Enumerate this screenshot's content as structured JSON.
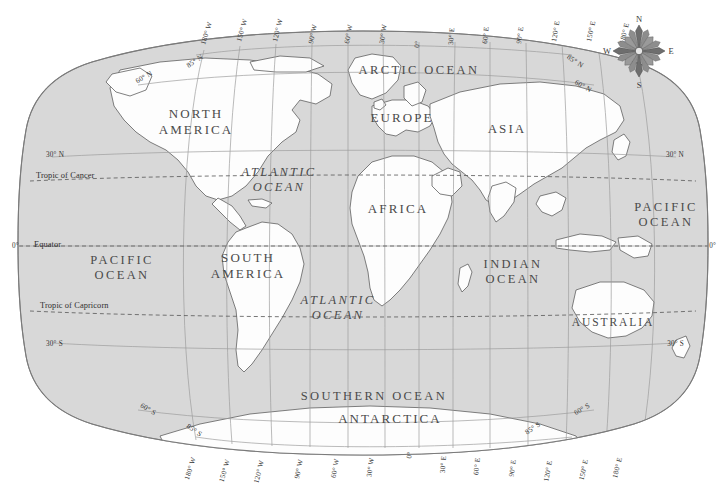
{
  "map": {
    "title": "World Map",
    "projection": "Robinson",
    "colors": {
      "ocean_fill": "#d9d9d9",
      "land_fill": "#fdfdfd",
      "graticule": "#9a9a9a",
      "coastline": "#6b6b6b",
      "outline": "#7a7a7a",
      "tropic_line": "#6f6f6f",
      "text": "#3a3a3a",
      "background": "#ffffff"
    },
    "continents": [
      {
        "label": "NORTH\nAMERICA",
        "line1": "NORTH",
        "line2": "AMERICA",
        "x": 196,
        "y": 118
      },
      {
        "label": "SOUTH\nAMERICA",
        "line1": "SOUTH",
        "line2": "AMERICA",
        "x": 248,
        "y": 262
      },
      {
        "label": "EUROPE",
        "line1": "EUROPE",
        "line2": "",
        "x": 402,
        "y": 122
      },
      {
        "label": "AFRICA",
        "line1": "AFRICA",
        "line2": "",
        "x": 398,
        "y": 213
      },
      {
        "label": "ASIA",
        "line1": "ASIA",
        "line2": "",
        "x": 507,
        "y": 133
      },
      {
        "label": "AUSTRALIA",
        "line1": "AUSTRALIA",
        "line2": "",
        "x": 613,
        "y": 326
      },
      {
        "label": "ANTARCTICA",
        "line1": "ANTARCTICA",
        "line2": "",
        "x": 390,
        "y": 423
      }
    ],
    "oceans": [
      {
        "line1": "ARCTIC",
        "line2": "OCEAN",
        "single": "ARCTIC OCEAN",
        "x": 419,
        "y": 74
      },
      {
        "line1": "ATLANTIC",
        "line2": "OCEAN",
        "single": "",
        "x": 279,
        "y": 176
      },
      {
        "line1": "ATLANTIC",
        "line2": "OCEAN",
        "single": "",
        "x": 338,
        "y": 304
      },
      {
        "line1": "PACIFIC",
        "line2": "OCEAN",
        "single": "",
        "x": 122,
        "y": 264
      },
      {
        "line1": "PACIFIC",
        "line2": "OCEAN",
        "single": "",
        "x": 666,
        "y": 211
      },
      {
        "line1": "INDIAN",
        "line2": "OCEAN",
        "single": "",
        "x": 513,
        "y": 268
      },
      {
        "line1": "SOUTHERN OCEAN",
        "line2": "",
        "single": "SOUTHERN OCEAN",
        "x": 374,
        "y": 400
      }
    ],
    "latitude_labels_left": [
      {
        "text": "30° N",
        "x": 52,
        "y": 157
      },
      {
        "text": "0°",
        "x": 14,
        "y": 247
      },
      {
        "text": "30° S",
        "x": 52,
        "y": 344
      }
    ],
    "latitude_labels_right": [
      {
        "text": "30° N",
        "x": 676,
        "y": 157
      },
      {
        "text": "0°",
        "x": 714,
        "y": 247
      },
      {
        "text": "30° S",
        "x": 676,
        "y": 344
      }
    ],
    "tropic_labels": [
      {
        "text": "Tropic of Cancer",
        "x": 36,
        "y": 177
      },
      {
        "text": "Equator",
        "x": 34,
        "y": 247
      },
      {
        "text": "Tropic of Capricorn",
        "x": 40,
        "y": 307
      }
    ],
    "polar_labels_top": [
      {
        "text": "85° N",
        "x": 196,
        "y": 63,
        "rot": -33
      },
      {
        "text": "60° N",
        "x": 145,
        "y": 79,
        "rot": -30
      },
      {
        "text": "85° N",
        "x": 572,
        "y": 63,
        "rot": 33
      },
      {
        "text": "60° N",
        "x": 580,
        "y": 88,
        "rot": 30
      }
    ],
    "polar_labels_bottom": [
      {
        "text": "85° S",
        "x": 193,
        "y": 432,
        "rot": 35
      },
      {
        "text": "60° S",
        "x": 147,
        "y": 411,
        "rot": 31
      },
      {
        "text": "85° S",
        "x": 534,
        "y": 430,
        "rot": -34
      },
      {
        "text": "60° S",
        "x": 583,
        "y": 411,
        "rot": -30
      }
    ],
    "longitude_labels_top": [
      {
        "text": "180° W",
        "x": 205,
        "y": 45,
        "rot": -72
      },
      {
        "text": "150° W",
        "x": 241,
        "y": 42,
        "rot": -74
      },
      {
        "text": "120° W",
        "x": 277,
        "y": 42,
        "rot": -76
      },
      {
        "text": "90° W",
        "x": 313,
        "y": 44,
        "rot": -78
      },
      {
        "text": "60° W",
        "x": 349,
        "y": 44,
        "rot": -80
      },
      {
        "text": "30° W",
        "x": 384,
        "y": 44,
        "rot": -82
      },
      {
        "text": "0°",
        "x": 419,
        "y": 48,
        "rot": -84
      },
      {
        "text": "30° E",
        "x": 453,
        "y": 45,
        "rot": 82
      },
      {
        "text": "60° E",
        "x": 487,
        "y": 44,
        "rot": 80
      },
      {
        "text": "90° E",
        "x": 521,
        "y": 44,
        "rot": 78
      },
      {
        "text": "120° E",
        "x": 556,
        "y": 42,
        "rot": 76
      },
      {
        "text": "150° E",
        "x": 591,
        "y": 42,
        "rot": 74
      },
      {
        "text": "180° E",
        "x": 624,
        "y": 44,
        "rot": 72
      }
    ],
    "longitude_labels_bottom": [
      {
        "text": "180° W",
        "x": 196,
        "y": 458,
        "rot": 72
      },
      {
        "text": "150° W",
        "x": 230,
        "y": 456,
        "rot": 74
      },
      {
        "text": "120° W",
        "x": 264,
        "y": 455,
        "rot": 76
      },
      {
        "text": "90° W",
        "x": 303,
        "y": 452,
        "rot": 78
      },
      {
        "text": "60° W",
        "x": 339,
        "y": 451,
        "rot": 80
      },
      {
        "text": "30° W",
        "x": 374,
        "y": 450,
        "rot": 82
      },
      {
        "text": "0°",
        "x": 410,
        "y": 446,
        "rot": 84
      },
      {
        "text": "30° E",
        "x": 444,
        "y": 449,
        "rot": -82
      },
      {
        "text": "60° E",
        "x": 478,
        "y": 451,
        "rot": -80
      },
      {
        "text": "90° E",
        "x": 514,
        "y": 452,
        "rot": -78
      },
      {
        "text": "120° E",
        "x": 550,
        "y": 455,
        "rot": -76
      },
      {
        "text": "150° E",
        "x": 586,
        "y": 456,
        "rot": -74
      },
      {
        "text": "180° E",
        "x": 620,
        "y": 458,
        "rot": -72
      }
    ],
    "compass": {
      "name": "compass-rose",
      "cx": 639,
      "cy": 51,
      "r": 26,
      "north": "N",
      "east": "E",
      "south": "S",
      "west": "W"
    }
  }
}
